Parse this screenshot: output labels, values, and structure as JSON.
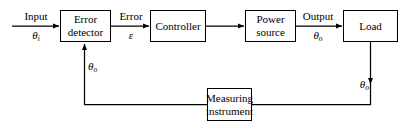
{
  "diagram": {
    "type": "block-diagram",
    "stroke_color": "#000000",
    "fill_color": "#ffffff",
    "blocks": [
      {
        "id": "error-detector",
        "line1": "Error",
        "line2": "detector"
      },
      {
        "id": "controller",
        "line1": "Controller",
        "line2": ""
      },
      {
        "id": "power-source",
        "line1": "Power",
        "line2": "source"
      },
      {
        "id": "load",
        "line1": "Load",
        "line2": ""
      },
      {
        "id": "measuring-instrument",
        "line1": "Measuring",
        "line2": "instrument"
      }
    ],
    "signals": {
      "input_label": "Input",
      "input_symbol": "θ",
      "input_subscript": "i",
      "error_label": "Error",
      "error_symbol": "ε",
      "output_label": "Output",
      "output_symbol": "θ",
      "output_subscript": "o",
      "feedback_symbol": "θ",
      "feedback_subscript": "o",
      "sensed_symbol": "θ",
      "sensed_subscript": "o"
    }
  }
}
